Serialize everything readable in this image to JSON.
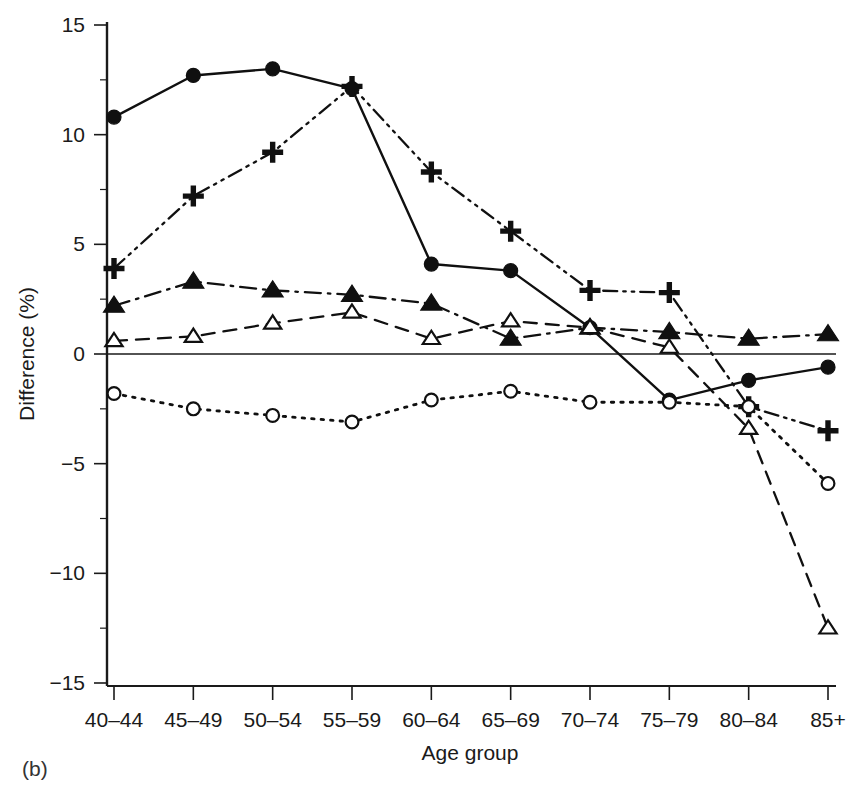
{
  "panel": {
    "label": "(b)"
  },
  "chart_data": {
    "type": "line",
    "title": "",
    "subtitle": "",
    "xlabel": "Age group",
    "ylabel": "Difference (%)",
    "categories": [
      "40–44",
      "45–49",
      "50–54",
      "55–59",
      "60–64",
      "65–69",
      "70–74",
      "75–79",
      "80–84",
      "85+"
    ],
    "x_tick_labels": [
      "40–44",
      "45–49",
      "50–54",
      "55–59",
      "60–64",
      "65–69",
      "70–74",
      "75–79",
      "80–84",
      "85+"
    ],
    "y_tick_labels": [
      "15",
      "10",
      "5",
      "0",
      "−5",
      "−10",
      "−15"
    ],
    "y_tick_values": [
      15,
      10,
      5,
      0,
      -5,
      -10,
      -15
    ],
    "y_minor_tick_values": [
      12.5,
      7.5,
      2.5,
      -2.5,
      -7.5,
      -12.5
    ],
    "ylim": [
      -15,
      15
    ],
    "grid": false,
    "legend": "none",
    "zero_reference_line": 0,
    "series": [
      {
        "name": "filled-circle",
        "marker": "filled-circle",
        "line_style": "solid",
        "values": [
          10.8,
          12.7,
          13.0,
          12.1,
          4.1,
          3.8,
          1.2,
          -2.1,
          -1.2,
          -0.6
        ]
      },
      {
        "name": "plus",
        "marker": "plus",
        "line_style": "dash-dot-dot",
        "values": [
          3.9,
          7.2,
          9.2,
          12.2,
          8.3,
          5.6,
          2.9,
          2.8,
          -2.4,
          -3.5
        ]
      },
      {
        "name": "filled-triangle",
        "marker": "filled-triangle",
        "line_style": "dash-dot",
        "values": [
          2.2,
          3.3,
          2.9,
          2.7,
          2.3,
          0.7,
          1.2,
          1.0,
          0.7,
          0.9
        ]
      },
      {
        "name": "open-triangle",
        "marker": "open-triangle",
        "line_style": "dashed",
        "values": [
          0.6,
          0.8,
          1.4,
          1.9,
          0.7,
          1.5,
          1.2,
          0.3,
          -3.4,
          -12.5
        ]
      },
      {
        "name": "open-circle",
        "marker": "open-circle",
        "line_style": "dotted",
        "values": [
          -1.8,
          -2.5,
          -2.8,
          -3.1,
          -2.1,
          -1.7,
          -2.2,
          -2.2,
          -2.4,
          -5.9
        ]
      }
    ]
  }
}
